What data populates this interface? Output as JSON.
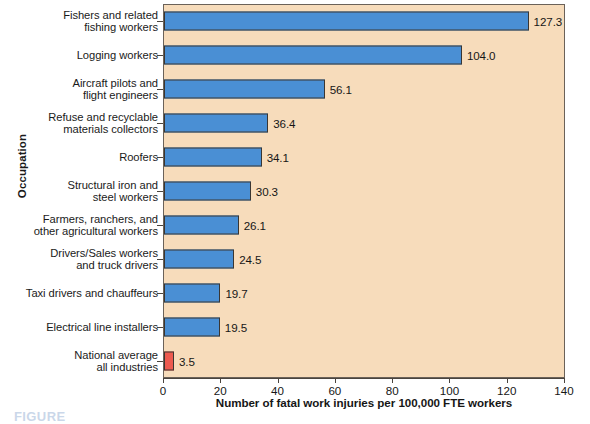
{
  "chart_data": {
    "type": "bar",
    "orientation": "horizontal",
    "title": "",
    "xlabel": "Number of fatal work injuries per 100,000 FTE workers",
    "ylabel": "Occupation",
    "xlim": [
      0,
      140
    ],
    "xticks": [
      0,
      20,
      40,
      60,
      80,
      100,
      120,
      140
    ],
    "grid": false,
    "legend": "none",
    "categories": [
      "Fishers and related fishing workers",
      "Logging workers",
      "Aircraft pilots and flight engineers",
      "Refuse and recyclable materials collectors",
      "Roofers",
      "Structural iron and steel workers",
      "Farmers, ranchers, and other agricultural workers",
      "Drivers/Sales workers and truck drivers",
      "Taxi drivers and chauffeurs",
      "Electrical line installers",
      "National average all industries"
    ],
    "values": [
      127.3,
      104.0,
      56.1,
      36.4,
      34.1,
      30.3,
      26.1,
      24.5,
      19.7,
      19.5,
      3.5
    ],
    "value_labels": [
      "127.3",
      "104.0",
      "56.1",
      "36.4",
      "34.1",
      "30.3",
      "26.1",
      "24.5",
      "19.7",
      "19.5",
      "3.5"
    ],
    "bars": [
      {
        "lines": [
          "Fishers and related",
          "fishing workers"
        ],
        "value": 127.3,
        "label": "127.3",
        "color": "#4a8fd4"
      },
      {
        "lines": [
          "Logging workers"
        ],
        "value": 104.0,
        "label": "104.0",
        "color": "#4a8fd4"
      },
      {
        "lines": [
          "Aircraft pilots and",
          "flight engineers"
        ],
        "value": 56.1,
        "label": "56.1",
        "color": "#4a8fd4"
      },
      {
        "lines": [
          "Refuse and recyclable",
          "materials collectors"
        ],
        "value": 36.4,
        "label": "36.4",
        "color": "#4a8fd4"
      },
      {
        "lines": [
          "Roofers"
        ],
        "value": 34.1,
        "label": "34.1",
        "color": "#4a8fd4"
      },
      {
        "lines": [
          "Structural iron and",
          "steel workers"
        ],
        "value": 30.3,
        "label": "30.3",
        "color": "#4a8fd4"
      },
      {
        "lines": [
          "Farmers, ranchers, and",
          "other agricultural workers"
        ],
        "value": 26.1,
        "label": "26.1",
        "color": "#4a8fd4"
      },
      {
        "lines": [
          "Drivers/Sales workers",
          "and truck drivers"
        ],
        "value": 24.5,
        "label": "24.5",
        "color": "#4a8fd4"
      },
      {
        "lines": [
          "Taxi drivers and chauffeurs"
        ],
        "value": 19.7,
        "label": "19.7",
        "color": "#4a8fd4"
      },
      {
        "lines": [
          "Electrical line installers"
        ],
        "value": 19.5,
        "label": "19.5",
        "color": "#4a8fd4"
      },
      {
        "lines": [
          "National average",
          "all industries"
        ],
        "value": 3.5,
        "label": "3.5",
        "color": "#ed5a4f"
      }
    ],
    "colors": {
      "bar": "#4a8fd4",
      "accent_bar": "#ed5a4f",
      "plot_background": "#f7dcbb",
      "axis": "#4a443e",
      "text": "#161616"
    }
  },
  "caption": {
    "text": "FIGURE"
  }
}
